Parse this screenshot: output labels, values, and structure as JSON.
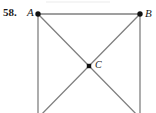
{
  "figure": {
    "exercise_number": "58.",
    "background_color": "#ffffff",
    "line_color": "#808080",
    "marker_color": "#111111",
    "label_color": "#1a1a1a",
    "stroke_width": 1.2,
    "cropped_bottom": true,
    "description_labels": {
      "a": "A",
      "b": "B",
      "c": "C"
    },
    "points": {
      "A": {
        "label": "A",
        "x": 38,
        "y": 14,
        "marker": "filled-circle",
        "radius": 2.6
      },
      "B": {
        "label": "B",
        "x": 140,
        "y": 14,
        "marker": "filled-circle",
        "radius": 2.6
      },
      "C": {
        "label": "C",
        "x": 89,
        "y": 66,
        "marker": "filled-square",
        "size": 4.4
      },
      "D": {
        "label": "",
        "x": 38,
        "y": 118,
        "marker": "none"
      },
      "E": {
        "label": "",
        "x": 140,
        "y": 118,
        "marker": "none"
      }
    },
    "segments": [
      {
        "name": "top-edge",
        "x1": 38,
        "y1": 14,
        "x2": 140,
        "y2": 14
      },
      {
        "name": "left-edge",
        "x1": 38,
        "y1": 14,
        "x2": 38,
        "y2": 118
      },
      {
        "name": "right-edge",
        "x1": 140,
        "y1": 14,
        "x2": 140,
        "y2": 118
      },
      {
        "name": "diagonal-a-to-e",
        "x1": 38,
        "y1": 14,
        "x2": 142,
        "y2": 120
      },
      {
        "name": "diagonal-b-to-d",
        "x1": 140,
        "y1": 14,
        "x2": 36,
        "y2": 120
      }
    ]
  }
}
